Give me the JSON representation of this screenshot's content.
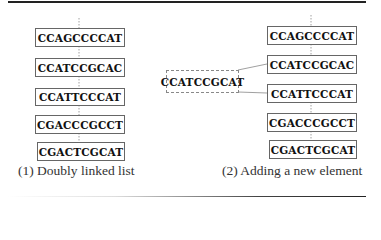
{
  "panels": [
    {
      "caption": "(1) Doubly linked list",
      "nodes": [
        "CCAGCCCCAT",
        "CCATCCGCAC",
        "CCATTCCCAT",
        "CGACCCGCCT",
        "CGACTCGCAT"
      ]
    },
    {
      "caption": "(2) Adding a new element",
      "nodes": [
        "CCAGCCCCAT",
        "CCATCCGCAC",
        "CCATTCCCAT",
        "CGACCCGCCT",
        "CGACTCGCAT"
      ],
      "new_node": "CCATCCGCAT"
    }
  ],
  "colors": {
    "box_border": "#666666",
    "rule": "#222222",
    "link": "#888888"
  }
}
